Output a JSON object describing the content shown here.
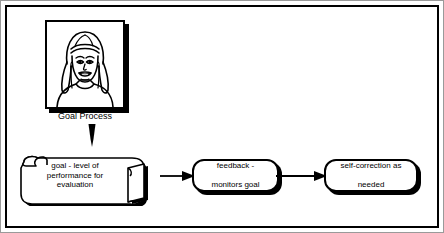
{
  "diagram": {
    "background_color": "#ffffff",
    "line_color": "#000000",
    "picture": {
      "name": "illustration-woman-face",
      "description": "line drawing of a smiling woman with long hair and headband",
      "caption": "Goal Process"
    },
    "nodes": [
      {
        "id": "goal",
        "shape": "scroll",
        "label": "goal - level of\nperformance for\nevaluation",
        "lines": [
          "goal - level of",
          "performance for",
          "evaluation"
        ]
      },
      {
        "id": "feedback",
        "shape": "rounded-rectangle",
        "label": "feedback -\nmonitors goal",
        "lines": [
          "feedback -",
          "monitors goal"
        ]
      },
      {
        "id": "self_correction",
        "shape": "rounded-rectangle",
        "label": "self-correction as\nneeded",
        "lines": [
          "self-correction as",
          "needed"
        ]
      }
    ],
    "connectors": [
      {
        "id": "c0",
        "from": "picture",
        "to": "goal",
        "direction": "down",
        "style": "solid-filled-arrow"
      },
      {
        "id": "c1",
        "from": "goal",
        "to": "feedback",
        "direction": "right",
        "style": "solid-filled-arrow"
      },
      {
        "id": "c2",
        "from": "feedback",
        "to": "self_correction",
        "direction": "right",
        "style": "solid-filled-arrow"
      }
    ]
  }
}
